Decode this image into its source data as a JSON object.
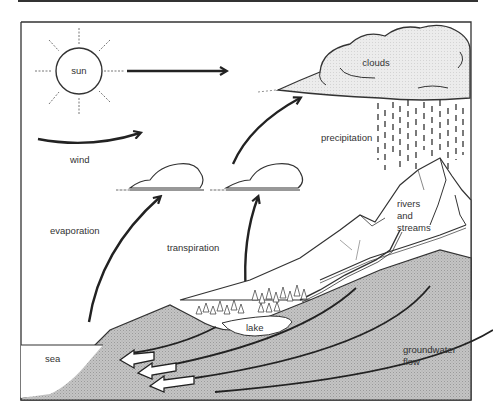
{
  "diagram": {
    "labels": {
      "sun": "sun",
      "clouds": "clouds",
      "wind": "wind",
      "precipitation": "precipitation",
      "evaporation": "evaporation",
      "transpiration": "transpiration",
      "rivers_line1": "rivers",
      "rivers_line2": "and",
      "rivers_line3": "streams",
      "lake": "lake",
      "sea": "sea",
      "groundwater_line1": "groundwater",
      "groundwater_line2": "flow"
    },
    "colors": {
      "line": "#222222",
      "land_fill": "#b8b8b8",
      "cloud_fill": "#e8e8e8",
      "background": "#ffffff"
    }
  }
}
